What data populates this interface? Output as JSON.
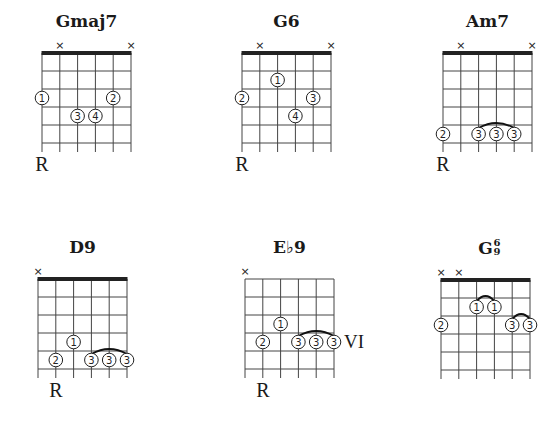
{
  "diagram": {
    "style": {
      "line_color": "#444444",
      "nut_color": "#222222",
      "background": "#ffffff",
      "string_spacing": 17.8,
      "fret_spacing": 18,
      "frets_shown": 5
    },
    "chords": [
      {
        "name": "Gmaj7",
        "name_base": "Gmaj7",
        "left": 42,
        "top": 53,
        "nut": true,
        "muted_strings": [
          1,
          5
        ],
        "fingers": [
          {
            "finger": "1",
            "string": 0,
            "fret": 3
          },
          {
            "finger": "2",
            "string": 4,
            "fret": 3
          },
          {
            "finger": "3",
            "string": 2,
            "fret": 4
          },
          {
            "finger": "4",
            "string": 3,
            "fret": 4
          }
        ],
        "barres": [],
        "root_label": "R",
        "root_string": 0,
        "position_label": ""
      },
      {
        "name": "G6",
        "name_base": "G6",
        "left": 242,
        "top": 53,
        "nut": true,
        "muted_strings": [
          1,
          5
        ],
        "fingers": [
          {
            "finger": "1",
            "string": 2,
            "fret": 2
          },
          {
            "finger": "2",
            "string": 0,
            "fret": 3
          },
          {
            "finger": "3",
            "string": 4,
            "fret": 3
          },
          {
            "finger": "4",
            "string": 3,
            "fret": 4
          }
        ],
        "barres": [],
        "root_label": "R",
        "root_string": 0,
        "position_label": ""
      },
      {
        "name": "Am7",
        "name_base": "Am7",
        "left": 443,
        "top": 53,
        "nut": true,
        "muted_strings": [
          1,
          5
        ],
        "fingers": [
          {
            "finger": "2",
            "string": 0,
            "fret": 5
          },
          {
            "finger": "3",
            "string": 2,
            "fret": 5
          },
          {
            "finger": "3",
            "string": 3,
            "fret": 5
          },
          {
            "finger": "3",
            "string": 4,
            "fret": 5
          }
        ],
        "barres": [
          {
            "from": 2,
            "to": 4,
            "fret": 5
          }
        ],
        "root_label": "R",
        "root_string": 0,
        "position_label": ""
      },
      {
        "name": "D9",
        "name_base": "D9",
        "left": 38,
        "top": 279,
        "nut": true,
        "muted_strings": [
          0
        ],
        "fingers": [
          {
            "finger": "1",
            "string": 2,
            "fret": 4
          },
          {
            "finger": "2",
            "string": 1,
            "fret": 5
          },
          {
            "finger": "3",
            "string": 3,
            "fret": 5
          },
          {
            "finger": "3",
            "string": 4,
            "fret": 5
          },
          {
            "finger": "3",
            "string": 5,
            "fret": 5
          }
        ],
        "barres": [
          {
            "from": 3,
            "to": 5,
            "fret": 5
          }
        ],
        "root_label": "R",
        "root_string": 1,
        "position_label": ""
      },
      {
        "name": "E♭9",
        "name_base": "E♭9",
        "left": 245,
        "top": 279,
        "nut": false,
        "muted_strings": [
          0
        ],
        "fingers": [
          {
            "finger": "1",
            "string": 2,
            "fret": 3
          },
          {
            "finger": "2",
            "string": 1,
            "fret": 4
          },
          {
            "finger": "3",
            "string": 3,
            "fret": 4
          },
          {
            "finger": "3",
            "string": 4,
            "fret": 4
          },
          {
            "finger": "3",
            "string": 5,
            "fret": 4
          }
        ],
        "barres": [
          {
            "from": 3,
            "to": 5,
            "fret": 4
          }
        ],
        "root_label": "R",
        "root_string": 1,
        "position_label": "VI",
        "position_fret": 4
      },
      {
        "name": "G6/9",
        "name_base": "G",
        "name_sup_top": "6",
        "name_sup_bottom": "9",
        "left": 441,
        "top": 280,
        "nut": true,
        "muted_strings": [
          0,
          1
        ],
        "fingers": [
          {
            "finger": "1",
            "string": 2,
            "fret": 2
          },
          {
            "finger": "1",
            "string": 3,
            "fret": 2
          },
          {
            "finger": "2",
            "string": 0,
            "fret": 3
          },
          {
            "finger": "3",
            "string": 4,
            "fret": 3
          },
          {
            "finger": "3",
            "string": 5,
            "fret": 3
          }
        ],
        "barres": [
          {
            "from": 2,
            "to": 3,
            "fret": 2
          },
          {
            "from": 4,
            "to": 5,
            "fret": 3
          }
        ],
        "root_label": "",
        "root_string": null,
        "position_label": ""
      }
    ]
  }
}
